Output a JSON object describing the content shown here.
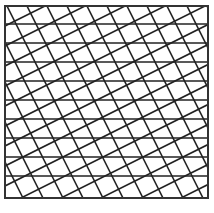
{
  "diagram": {
    "title": "Lattice grid pattern",
    "colors": {
      "line": "#222222",
      "background": "#ffffff",
      "border": "#333333"
    },
    "frame": {
      "x": 5,
      "y": 6,
      "width": 203,
      "height": 192
    },
    "horizontal_lines_y": [
      24,
      43,
      62,
      81,
      100,
      119,
      138,
      157,
      176
    ],
    "steep_family": {
      "slope": 2.0,
      "spacing_x": 20,
      "offset_x": 7
    },
    "shallow_family": {
      "slope": -0.5,
      "spacing_y": 20,
      "offset_y": 6
    }
  }
}
